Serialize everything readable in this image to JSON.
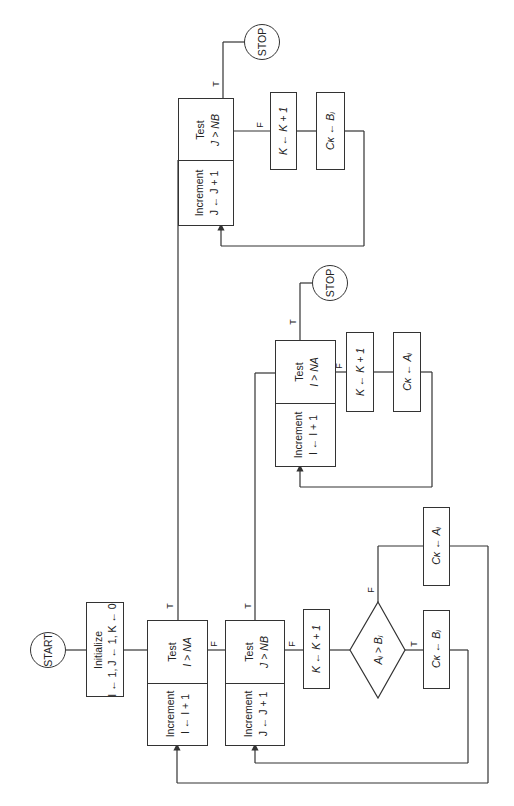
{
  "diagram": {
    "type": "flowchart",
    "orientation": "rotated 90 degrees counter-clockwise",
    "nodes": {
      "start": {
        "label": "START"
      },
      "initialize": {
        "line1": "Initialize",
        "line2": "I ← 1, J ← 1, K ← 0"
      },
      "test_i_main": {
        "title": "Test",
        "cond": "I > NA"
      },
      "incr_i_main": {
        "title": "Increment",
        "expr": "I ← I + 1"
      },
      "test_j_main": {
        "title": "Test",
        "cond": "J > NB"
      },
      "incr_j_main": {
        "title": "Increment",
        "expr": "J ← J + 1"
      },
      "k_incr_main": {
        "label": "K ← K + 1"
      },
      "compare": {
        "label": "Aᵢ > Bⱼ"
      },
      "ck_bj_main": {
        "label": "Cκ ← Bⱼ"
      },
      "ck_ai_main": {
        "label": "Cκ ← Aᵢ"
      },
      "test_i_tail": {
        "title": "Test",
        "cond": "I > NA"
      },
      "incr_i_tail": {
        "title": "Increment",
        "expr": "I ← I + 1"
      },
      "k_incr_a_tail": {
        "label": "K ← K + 1"
      },
      "ck_ai_tail": {
        "label": "Cκ ← Aᵢ"
      },
      "stop_a": {
        "label": "STOP"
      },
      "test_j_tail": {
        "title": "Test",
        "cond": "J > NB"
      },
      "incr_j_tail": {
        "title": "Increment",
        "expr": "J ← J + 1"
      },
      "k_incr_b_tail": {
        "label": "K ← K + 1"
      },
      "ck_bj_tail": {
        "label": "Cκ ← Bⱼ"
      },
      "stop_b": {
        "label": "STOP"
      }
    },
    "edge_labels": {
      "true": "T",
      "false": "F"
    }
  }
}
